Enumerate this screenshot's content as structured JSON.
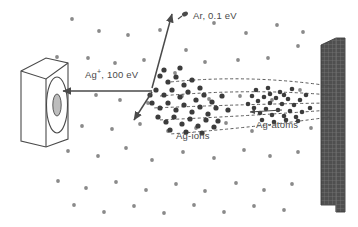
{
  "figure": {
    "type": "schematic",
    "background_color": "#ffffff",
    "ink_color": "#4a4a4a",
    "target_color": "#4b4b4b"
  },
  "labels": {
    "ar": {
      "text": "Ar, 0.1 eV",
      "species": "Ar",
      "energy": "0.1 eV"
    },
    "ag_ion": {
      "text": "Ag",
      "sup": "+",
      "rest": ", 100 eV",
      "species": "Ag+",
      "energy": "100 eV"
    },
    "ag_ions": {
      "text": "Ag-ions"
    },
    "ag_atoms": {
      "text": "Ag-atoms"
    }
  },
  "objects": {
    "substrate": {
      "name": "substrate-holder",
      "shape": "3d-box-with-disc"
    },
    "target": {
      "name": "sputter-target",
      "shape": "hatched-slab"
    }
  },
  "icons": {
    "ar_marker": "argon-particle-icon",
    "arrow_ion_beam": "arrow-left-icon",
    "arrow_scatter_up": "arrow-up-icon",
    "arrow_scatter_down": "arrow-down-left-icon"
  },
  "chart_data": {
    "type": "scatter",
    "title": "",
    "xlabel": "",
    "ylabel": "",
    "background_gas_dots": [
      [
        72,
        19
      ],
      [
        99,
        31
      ],
      [
        128,
        35
      ],
      [
        160,
        30
      ],
      [
        186,
        50
      ],
      [
        214,
        23
      ],
      [
        246,
        33
      ],
      [
        277,
        25
      ],
      [
        303,
        32
      ],
      [
        57,
        57
      ],
      [
        88,
        58
      ],
      [
        115,
        63
      ],
      [
        144,
        60
      ],
      [
        175,
        73
      ],
      [
        205,
        62
      ],
      [
        238,
        60
      ],
      [
        268,
        58
      ],
      [
        298,
        46
      ],
      [
        62,
        89
      ],
      [
        96,
        95
      ],
      [
        120,
        100
      ],
      [
        148,
        103
      ],
      [
        182,
        96
      ],
      [
        209,
        99
      ],
      [
        240,
        96
      ],
      [
        272,
        100
      ],
      [
        300,
        90
      ],
      [
        54,
        120
      ],
      [
        82,
        126
      ],
      [
        112,
        129
      ],
      [
        140,
        124
      ],
      [
        168,
        131
      ],
      [
        196,
        128
      ],
      [
        226,
        123
      ],
      [
        252,
        131
      ],
      [
        286,
        120
      ],
      [
        311,
        128
      ],
      [
        68,
        151
      ],
      [
        98,
        156
      ],
      [
        126,
        148
      ],
      [
        152,
        160
      ],
      [
        183,
        152
      ],
      [
        214,
        158
      ],
      [
        244,
        150
      ],
      [
        270,
        156
      ],
      [
        298,
        152
      ],
      [
        58,
        181
      ],
      [
        86,
        188
      ],
      [
        116,
        182
      ],
      [
        146,
        190
      ],
      [
        176,
        184
      ],
      [
        205,
        191
      ],
      [
        236,
        183
      ],
      [
        264,
        190
      ],
      [
        292,
        184
      ],
      [
        74,
        205
      ],
      [
        104,
        212
      ],
      [
        134,
        206
      ],
      [
        164,
        213
      ],
      [
        194,
        205
      ],
      [
        224,
        212
      ],
      [
        254,
        206
      ],
      [
        284,
        210
      ]
    ],
    "ion_cluster_dots": [
      [
        160,
        76
      ],
      [
        168,
        82
      ],
      [
        176,
        77
      ],
      [
        184,
        85
      ],
      [
        192,
        80
      ],
      [
        200,
        88
      ],
      [
        156,
        90
      ],
      [
        164,
        95
      ],
      [
        172,
        90
      ],
      [
        180,
        97
      ],
      [
        188,
        92
      ],
      [
        196,
        100
      ],
      [
        204,
        95
      ],
      [
        212,
        102
      ],
      [
        152,
        103
      ],
      [
        160,
        108
      ],
      [
        168,
        103
      ],
      [
        176,
        110
      ],
      [
        184,
        105
      ],
      [
        192,
        112
      ],
      [
        200,
        107
      ],
      [
        208,
        114
      ],
      [
        216,
        108
      ],
      [
        158,
        117
      ],
      [
        166,
        122
      ],
      [
        174,
        117
      ],
      [
        182,
        124
      ],
      [
        190,
        119
      ],
      [
        198,
        126
      ],
      [
        206,
        120
      ],
      [
        214,
        127
      ],
      [
        150,
        95
      ],
      [
        222,
        96
      ],
      [
        228,
        110
      ],
      [
        170,
        130
      ],
      [
        186,
        132
      ],
      [
        202,
        133
      ],
      [
        218,
        121
      ],
      [
        164,
        70
      ],
      [
        180,
        68
      ]
    ],
    "atom_cluster_dots": [
      [
        252,
        96
      ],
      [
        258,
        101
      ],
      [
        264,
        97
      ],
      [
        270,
        103
      ],
      [
        276,
        98
      ],
      [
        282,
        104
      ],
      [
        288,
        99
      ],
      [
        294,
        105
      ],
      [
        300,
        100
      ],
      [
        254,
        108
      ],
      [
        260,
        113
      ],
      [
        266,
        109
      ],
      [
        272,
        115
      ],
      [
        278,
        110
      ],
      [
        284,
        116
      ],
      [
        290,
        111
      ],
      [
        296,
        117
      ],
      [
        302,
        112
      ],
      [
        256,
        90
      ],
      [
        268,
        88
      ],
      [
        280,
        92
      ],
      [
        292,
        89
      ],
      [
        248,
        104
      ],
      [
        306,
        95
      ],
      [
        310,
        108
      ],
      [
        262,
        120
      ],
      [
        274,
        122
      ],
      [
        286,
        120
      ],
      [
        298,
        121
      ],
      [
        270,
        94
      ],
      [
        284,
        95
      ]
    ],
    "trajectories": [
      {
        "name": "traj-1",
        "from": [
          330,
          86
        ],
        "cp": [
          250,
          74
        ],
        "to": [
          170,
          82
        ]
      },
      {
        "name": "traj-2",
        "from": [
          330,
          95
        ],
        "cp": [
          250,
          88
        ],
        "to": [
          160,
          96
        ]
      },
      {
        "name": "traj-3",
        "from": [
          330,
          103
        ],
        "cp": [
          250,
          104
        ],
        "to": [
          152,
          108
        ]
      },
      {
        "name": "traj-4",
        "from": [
          330,
          110
        ],
        "cp": [
          250,
          116
        ],
        "to": [
          158,
          120
        ]
      },
      {
        "name": "traj-5",
        "from": [
          330,
          117
        ],
        "cp": [
          250,
          128
        ],
        "to": [
          170,
          134
        ]
      }
    ],
    "arrows": [
      {
        "name": "ion-beam-arrow",
        "from": [
          152,
          91
        ],
        "to": [
          63,
          91
        ],
        "style": "solid"
      },
      {
        "name": "scatter-up-arrow",
        "from": [
          152,
          88
        ],
        "to": [
          172,
          14
        ],
        "style": "solid"
      },
      {
        "name": "scatter-down-arrow",
        "from": [
          152,
          92
        ],
        "to": [
          134,
          120
        ],
        "style": "solid"
      },
      {
        "name": "inner-arrow-left",
        "from": [
          282,
          110
        ],
        "to": [
          250,
          112
        ],
        "style": "solid"
      }
    ]
  }
}
